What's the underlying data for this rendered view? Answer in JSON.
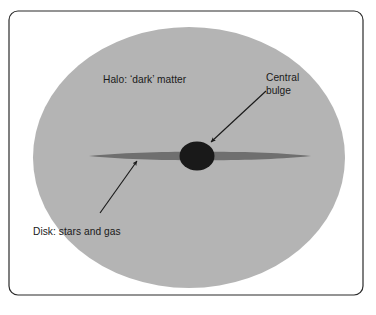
{
  "figure": {
    "domain_type": "diagram",
    "background_color": "#ffffff",
    "frame": {
      "name": "figure-border",
      "stroke_color": "#2b2b2b",
      "stroke_width": 1.2,
      "corner_radius": 9,
      "x": 9,
      "y": 11,
      "width": 354,
      "height": 284
    }
  },
  "shapes": {
    "halo": {
      "name": "halo-ellipse",
      "fill_color": "#b4b4b4",
      "cx": 189,
      "cy": 157.5,
      "rx": 156,
      "ry": 130.5
    },
    "disk": {
      "name": "disk-lens",
      "fill_color": "#6f6f6f",
      "left_tip_x": 89,
      "right_tip_x": 311,
      "center_y": 156,
      "max_half_thickness": 4.2
    },
    "bulge": {
      "name": "central-bulge-ellipse",
      "fill_color": "#191919",
      "cx": 197,
      "cy": 156,
      "rx": 17.5,
      "ry": 14.5
    }
  },
  "labels": {
    "halo": {
      "name": "halo-label",
      "text": "Halo: ‘dark’ matter",
      "x": 103,
      "y": 83,
      "anchor": "start"
    },
    "central_bulge": {
      "name": "central-bulge-label",
      "line1": "Central",
      "line2": "bulge",
      "x": 266,
      "y": 81,
      "line_height": 13,
      "anchor": "start"
    },
    "disk": {
      "name": "disk-label",
      "text": "Disk: stars and gas",
      "x": 33,
      "y": 235,
      "anchor": "start"
    }
  },
  "arrows": {
    "bulge_arrow": {
      "name": "central-bulge-arrow",
      "stroke_color": "#1a1a1a",
      "stroke_width": 1.15,
      "tail_x": 266,
      "tail_y": 91,
      "head_x": 211,
      "head_y": 142,
      "head_size": 4.6
    },
    "disk_arrow": {
      "name": "disk-arrow",
      "stroke_color": "#1a1a1a",
      "stroke_width": 1.15,
      "tail_x": 100,
      "tail_y": 213,
      "head_x": 137,
      "head_y": 161,
      "head_size": 4.6
    }
  },
  "colors": {
    "halo_gray": "#b4b4b4",
    "disk_gray": "#6f6f6f",
    "bulge_black": "#191919",
    "text_black": "#1a1a1a",
    "border_black": "#2b2b2b",
    "page_white": "#ffffff"
  }
}
